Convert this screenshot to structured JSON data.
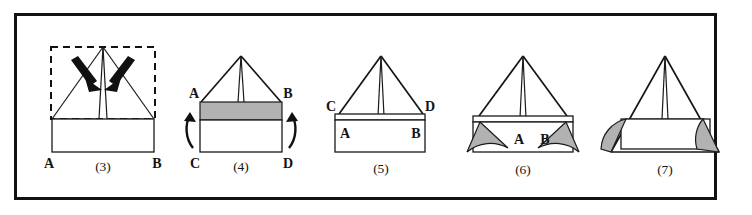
{
  "figure": {
    "background_color": "#ffffff",
    "frame_color": "#121212",
    "ink_color": "#151515",
    "shade_color": "#b2b2b2"
  },
  "panels": [
    {
      "id": "panel-3",
      "caption": "(3)",
      "corner_labels": {
        "bottom_left": "A",
        "bottom_right": "B"
      },
      "has_dashed_outline": true,
      "arrows": [
        {
          "name": "arrow-fold-left",
          "direction": "down-right"
        },
        {
          "name": "arrow-fold-right",
          "direction": "down-left"
        }
      ],
      "shaded_regions": 0,
      "description": "Dashed outline around flat sheet with tent peak pulled up and two bold arrows pressing inward"
    },
    {
      "id": "panel-4",
      "caption": "(4)",
      "corner_labels": {
        "top_left": "A",
        "top_right": "B",
        "bottom_left": "C",
        "bottom_right": "D"
      },
      "has_dashed_outline": false,
      "arrows": [
        {
          "name": "arrow-rotate-left",
          "direction": "curved-up"
        },
        {
          "name": "arrow-rotate-right",
          "direction": "curved-up"
        }
      ],
      "shaded_regions": 1,
      "description": "Tent above rectangle whose upper band is shaded; curved arrows on both sides indicate folding up"
    },
    {
      "id": "panel-5",
      "caption": "(5)",
      "corner_labels": {
        "top_left": "C",
        "top_right": "D",
        "inner_left": "A",
        "inner_right": "B"
      },
      "has_dashed_outline": false,
      "arrows": [],
      "shaded_regions": 0,
      "description": "Edges C and D now sit outside while A and B are tucked inside the rectangle"
    },
    {
      "id": "panel-6",
      "caption": "(6)",
      "corner_labels": {
        "inner_left": "A",
        "inner_right": "B"
      },
      "has_dashed_outline": false,
      "arrows": [],
      "shaded_regions": 2,
      "description": "Shaded fan shaped corner flaps splay outward at A and B"
    },
    {
      "id": "panel-7",
      "caption": "(7)",
      "corner_labels": {},
      "has_dashed_outline": false,
      "arrows": [],
      "shaded_regions": 2,
      "description": "Finished tent with shaded corner flaps folded in against the base"
    }
  ]
}
